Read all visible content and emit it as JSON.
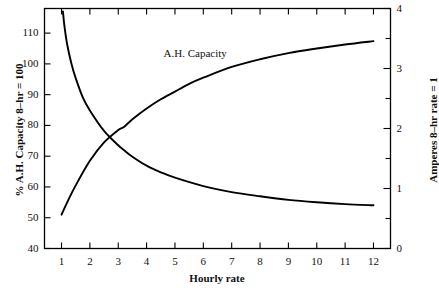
{
  "chart_data": {
    "type": "line",
    "title": "",
    "annotation": "A.H. Capacity",
    "xlabel": "Hourly rate",
    "ylabel_left": "% A.H. Capacity 8–hr = 100",
    "ylabel_right": "Amperes 8–hr rate = 1",
    "xlim": [
      0.4,
      12.6
    ],
    "ylim_left": [
      40,
      118
    ],
    "ylim_right": [
      0,
      4
    ],
    "xticks": [
      1,
      2,
      3,
      4,
      5,
      6,
      7,
      8,
      9,
      10,
      11,
      12
    ],
    "xticklabels": [
      "1",
      "2",
      "3",
      "4",
      "5",
      "6",
      "7",
      "8",
      "9",
      "10",
      "11",
      "12"
    ],
    "yticks_left": [
      40,
      50,
      60,
      70,
      80,
      90,
      100,
      110
    ],
    "yticklabels_left": [
      "40",
      "50",
      "60",
      "70",
      "80",
      "90",
      "100",
      "110"
    ],
    "yticks_right": [
      0,
      1,
      2,
      3,
      4
    ],
    "yticklabels_right": [
      "0",
      "1",
      "2",
      "3",
      "4"
    ],
    "yminorticks_right": [
      0.5,
      1.5,
      2.5,
      3.5
    ],
    "grid": false,
    "legend": "none",
    "series": [
      {
        "name": "A.H. Capacity",
        "axis": "left",
        "x": [
          1.0,
          1.2,
          1.5,
          2.0,
          2.5,
          3.0,
          3.2,
          3.5,
          4.0,
          4.5,
          5.0,
          5.5,
          6.0,
          7.0,
          8.0,
          9.0,
          10.0,
          11.0,
          12.0
        ],
        "values": [
          51.0,
          55.0,
          60.5,
          68.5,
          74.5,
          78.5,
          79.5,
          82.0,
          85.5,
          88.5,
          91.0,
          93.5,
          95.5,
          99.0,
          101.5,
          103.5,
          105.0,
          106.3,
          107.4
        ]
      },
      {
        "name": "Amperes",
        "axis": "right",
        "x": [
          1.0,
          1.05,
          1.1,
          1.2,
          1.35,
          1.5,
          1.75,
          2.0,
          2.5,
          3.0,
          3.2,
          3.5,
          4.0,
          4.5,
          5.0,
          6.0,
          7.0,
          8.0,
          9.0,
          10.0,
          11.0,
          12.0
        ],
        "values": [
          4.15,
          3.95,
          3.72,
          3.4,
          3.08,
          2.84,
          2.52,
          2.3,
          1.96,
          1.72,
          1.64,
          1.53,
          1.38,
          1.27,
          1.18,
          1.04,
          0.94,
          0.87,
          0.81,
          0.77,
          0.74,
          0.72
        ]
      }
    ],
    "colors": {
      "axis": "#000000",
      "curve": "#000000",
      "background": "#ffffff"
    }
  }
}
